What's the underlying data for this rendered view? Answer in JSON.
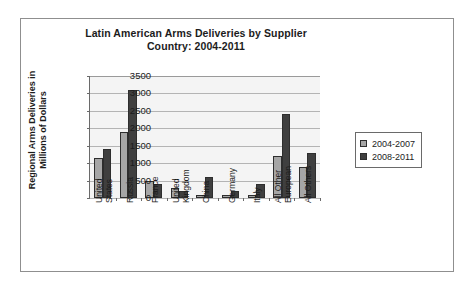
{
  "chart_data": {
    "type": "bar",
    "title": "Latin American Arms Deliveries by Supplier Country: 2004-2011",
    "title_lines": [
      "Latin American Arms Deliveries by Supplier",
      "Country: 2004-2011"
    ],
    "xlabel": "",
    "ylabel": "Regional Arms Deliveries in Millions of Dollars",
    "ylabel_lines": [
      "Regional Arms Deliveries in",
      "Millions of Dollars"
    ],
    "ylim": [
      0,
      3500
    ],
    "ytick_values": [
      3500,
      3000,
      2500,
      2000,
      1500,
      1000,
      500,
      0
    ],
    "ytick_labels": [
      "3500",
      "3000",
      "2500",
      "2000",
      "1500",
      "1000",
      "500",
      "0"
    ],
    "grid": true,
    "grid_axis": "y",
    "legend_position": "right",
    "categories": [
      "United States",
      "Russia",
      "France",
      "United Kingdom",
      "China",
      "Germany",
      "Italy",
      "All Other European",
      "All Others"
    ],
    "category_label_lines": [
      [
        "United",
        "States"
      ],
      [
        "Russia"
      ],
      [
        "France"
      ],
      [
        "United",
        "Kingdom"
      ],
      [
        "China"
      ],
      [
        "Germany"
      ],
      [
        "Italy"
      ],
      [
        "All Other",
        "European"
      ],
      [
        "All Others"
      ]
    ],
    "series": [
      {
        "name": "2004-2007",
        "color": "#a6a6a6",
        "values": [
          1150,
          1900,
          500,
          300,
          100,
          100,
          100,
          1200,
          900
        ]
      },
      {
        "name": "2008-2011",
        "color": "#3f3f3f",
        "values": [
          1400,
          3100,
          400,
          200,
          600,
          200,
          400,
          2400,
          1300
        ]
      }
    ]
  },
  "colors": {
    "series_2004_2007": "#a6a6a6",
    "series_2008_2011": "#3f3f3f",
    "plot_background": "#f4f4f4",
    "gridline": "#b4b4b4",
    "axis": "#6a6a6a",
    "frame_border": "#8f8f8f",
    "text": "#1c1c1c"
  }
}
